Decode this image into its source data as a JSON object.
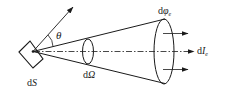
{
  "diagram": {
    "type": "radiometry-solid-angle",
    "colors": {
      "stroke": "#1a1a1a",
      "background": "#ffffff"
    },
    "labels": {
      "theta": "θ",
      "area_element_prefix": "d",
      "area_element_var": "S",
      "solid_angle_prefix": "d",
      "solid_angle_var": "Ω",
      "flux_prefix": "d",
      "flux_var": "φ",
      "flux_sub": "e",
      "intensity_prefix": "d",
      "intensity_var": "I",
      "intensity_sub": "e"
    },
    "elements": [
      "surface-element-dS",
      "surface-normal-arrow",
      "angle-theta",
      "cone-of-radiation",
      "solid-angle-ellipse-dOmega",
      "cone-base-ellipse",
      "dash-dot-axis",
      "flux-arrows"
    ]
  }
}
